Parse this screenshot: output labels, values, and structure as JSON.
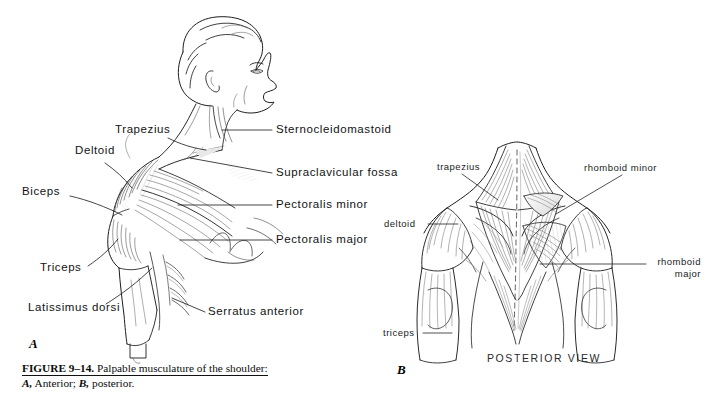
{
  "figure": {
    "caption_number": "FIGURE 9–14.",
    "caption_title": "Palpable musculature of the shoulder:",
    "caption_line2_a": "A,",
    "caption_line2_a_text": "Anterior;",
    "caption_line2_b": "B,",
    "caption_line2_b_text": "posterior."
  },
  "panel_a": {
    "letter": "A",
    "labels": {
      "trapezius": "Trapezius",
      "deltoid": "Deltoid",
      "biceps": "Biceps",
      "triceps": "Triceps",
      "latissimus_dorsi": "Latissimus dorsi",
      "sternocleidomastoid": "Sternocleidomastoid",
      "supraclavicular_fossa": "Supraclavicular  fossa",
      "pectoralis_minor": "Pectoralis  minor",
      "pectoralis_major": "Pectoralis  major",
      "serratus_anterior": "Serratus anterior"
    }
  },
  "panel_b": {
    "letter": "B",
    "view_caption": "POSTERIOR  VIEW",
    "labels": {
      "trapezius": "trapezius",
      "deltoid": "deltoid",
      "triceps": "triceps",
      "rhomboid_minor": "rhomboid  minor",
      "rhomboid_major_line1": "rhomboid",
      "rhomboid_major_line2": "major"
    }
  },
  "colors": {
    "background": "#ffffff",
    "ink": "#1a1a1a",
    "leader_line": "#2b2b2b",
    "shading_light": "#bfbfbf",
    "shading_mid": "#8d8d8d",
    "shading_dark": "#4a4a4a"
  }
}
